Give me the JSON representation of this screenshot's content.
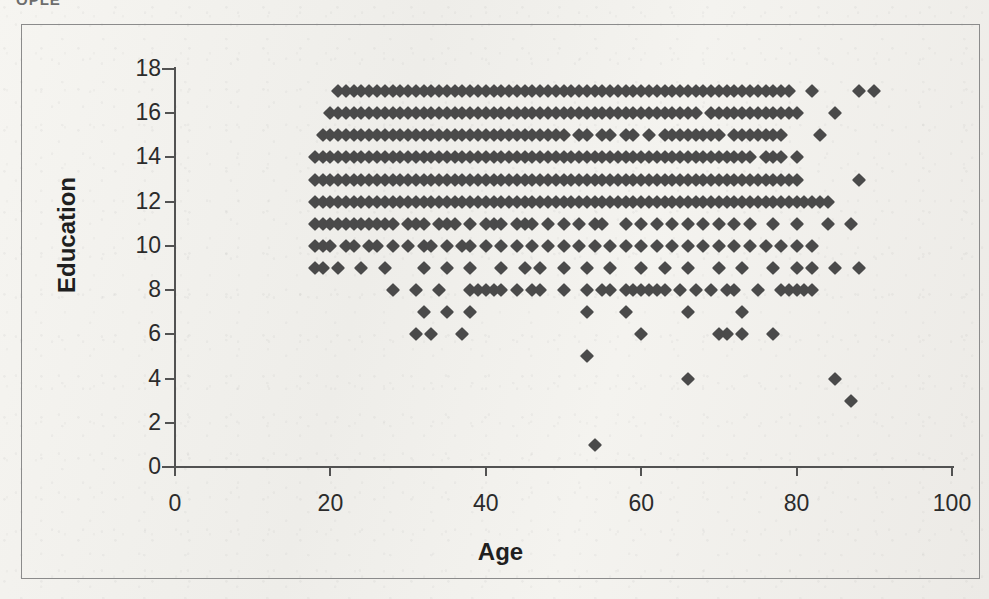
{
  "page": {
    "top_cut_text": "OPLE",
    "background_color": "#f2f1ed",
    "frame_color": "#8b8b8b"
  },
  "chart_data": {
    "type": "scatter",
    "title": "",
    "xlabel": "Age",
    "ylabel": "Education",
    "xlim": [
      0,
      100
    ],
    "ylim": [
      0,
      18
    ],
    "xticks": [
      0,
      20,
      40,
      60,
      80,
      100
    ],
    "yticks": [
      0,
      2,
      4,
      6,
      8,
      10,
      12,
      14,
      16,
      18
    ],
    "grid": false,
    "legend": false,
    "marker": "diamond",
    "marker_color": "#4a4a4a",
    "marker_size_px": 14,
    "series": [
      {
        "name": "Education vs Age",
        "rows": [
          {
            "education": 17,
            "ages": [
              21,
              22,
              23,
              24,
              25,
              26,
              27,
              28,
              29,
              30,
              31,
              32,
              33,
              34,
              35,
              36,
              37,
              38,
              39,
              40,
              41,
              42,
              43,
              44,
              45,
              46,
              47,
              48,
              49,
              50,
              51,
              52,
              53,
              54,
              55,
              56,
              57,
              58,
              59,
              60,
              61,
              62,
              63,
              64,
              65,
              66,
              67,
              68,
              69,
              70,
              71,
              72,
              73,
              74,
              75,
              76,
              77,
              78,
              79,
              82,
              88,
              90
            ]
          },
          {
            "education": 16,
            "ages": [
              20,
              21,
              22,
              23,
              24,
              25,
              26,
              27,
              28,
              29,
              30,
              31,
              32,
              33,
              34,
              35,
              36,
              37,
              38,
              39,
              40,
              41,
              42,
              43,
              44,
              45,
              46,
              47,
              48,
              49,
              50,
              51,
              52,
              53,
              54,
              55,
              56,
              57,
              58,
              59,
              60,
              61,
              62,
              63,
              64,
              65,
              66,
              67,
              69,
              70,
              71,
              72,
              73,
              74,
              75,
              76,
              77,
              78,
              79,
              80,
              85
            ]
          },
          {
            "education": 15,
            "ages": [
              19,
              20,
              21,
              22,
              23,
              24,
              25,
              26,
              27,
              28,
              29,
              30,
              31,
              32,
              33,
              34,
              35,
              36,
              37,
              38,
              39,
              40,
              41,
              42,
              43,
              44,
              45,
              46,
              47,
              48,
              49,
              50,
              52,
              53,
              55,
              56,
              58,
              59,
              61,
              63,
              64,
              65,
              66,
              67,
              68,
              69,
              70,
              72,
              73,
              74,
              75,
              76,
              77,
              78,
              83
            ]
          },
          {
            "education": 14,
            "ages": [
              18,
              19,
              20,
              21,
              22,
              23,
              24,
              25,
              26,
              27,
              28,
              29,
              30,
              31,
              32,
              33,
              34,
              35,
              36,
              37,
              38,
              39,
              40,
              41,
              42,
              43,
              44,
              45,
              46,
              47,
              48,
              49,
              50,
              51,
              52,
              53,
              54,
              55,
              56,
              57,
              58,
              59,
              60,
              61,
              62,
              63,
              64,
              65,
              66,
              67,
              68,
              69,
              70,
              71,
              72,
              73,
              74,
              76,
              77,
              78,
              80
            ]
          },
          {
            "education": 13,
            "ages": [
              18,
              19,
              20,
              21,
              22,
              23,
              24,
              25,
              26,
              27,
              28,
              29,
              30,
              31,
              32,
              33,
              34,
              35,
              36,
              37,
              38,
              39,
              40,
              41,
              42,
              43,
              44,
              45,
              46,
              47,
              48,
              49,
              50,
              51,
              52,
              53,
              54,
              55,
              56,
              57,
              58,
              59,
              60,
              61,
              62,
              63,
              64,
              65,
              66,
              67,
              68,
              69,
              70,
              71,
              72,
              73,
              74,
              75,
              76,
              77,
              78,
              79,
              80,
              88
            ]
          },
          {
            "education": 12,
            "ages": [
              18,
              19,
              20,
              21,
              22,
              23,
              24,
              25,
              26,
              27,
              28,
              29,
              30,
              31,
              32,
              33,
              34,
              35,
              36,
              37,
              38,
              39,
              40,
              41,
              42,
              43,
              44,
              45,
              46,
              47,
              48,
              49,
              50,
              51,
              52,
              53,
              54,
              55,
              56,
              57,
              58,
              59,
              60,
              61,
              62,
              63,
              64,
              65,
              66,
              67,
              68,
              69,
              70,
              71,
              72,
              73,
              74,
              75,
              76,
              77,
              78,
              79,
              80,
              81,
              82,
              83,
              84
            ]
          },
          {
            "education": 11,
            "ages": [
              18,
              19,
              20,
              21,
              22,
              23,
              24,
              25,
              26,
              27,
              28,
              30,
              31,
              32,
              34,
              35,
              36,
              38,
              40,
              41,
              42,
              44,
              45,
              46,
              48,
              50,
              52,
              54,
              55,
              58,
              60,
              62,
              64,
              66,
              68,
              70,
              72,
              74,
              77,
              80,
              84,
              87
            ]
          },
          {
            "education": 10,
            "ages": [
              18,
              19,
              20,
              22,
              23,
              25,
              26,
              28,
              30,
              32,
              33,
              35,
              37,
              38,
              40,
              42,
              44,
              46,
              48,
              50,
              52,
              54,
              56,
              58,
              60,
              62,
              64,
              66,
              68,
              70,
              72,
              74,
              76,
              78,
              80,
              82
            ]
          },
          {
            "education": 9,
            "ages": [
              18,
              19,
              21,
              24,
              27,
              32,
              35,
              38,
              42,
              45,
              47,
              50,
              53,
              56,
              60,
              63,
              66,
              70,
              73,
              77,
              80,
              82,
              85,
              88
            ]
          },
          {
            "education": 8,
            "ages": [
              28,
              31,
              34,
              38,
              39,
              40,
              41,
              42,
              44,
              46,
              47,
              50,
              53,
              55,
              56,
              58,
              59,
              60,
              61,
              62,
              63,
              65,
              67,
              69,
              71,
              72,
              75,
              78,
              79,
              80,
              81,
              82
            ]
          },
          {
            "education": 7,
            "ages": [
              32,
              35,
              38,
              53,
              58,
              66,
              73
            ]
          },
          {
            "education": 6,
            "ages": [
              31,
              33,
              37,
              60,
              70,
              71,
              73,
              77
            ]
          },
          {
            "education": 5,
            "ages": [
              53
            ]
          },
          {
            "education": 4,
            "ages": [
              66,
              85
            ]
          },
          {
            "education": 3,
            "ages": [
              87
            ]
          },
          {
            "education": 1,
            "ages": [
              54
            ]
          }
        ]
      }
    ]
  }
}
